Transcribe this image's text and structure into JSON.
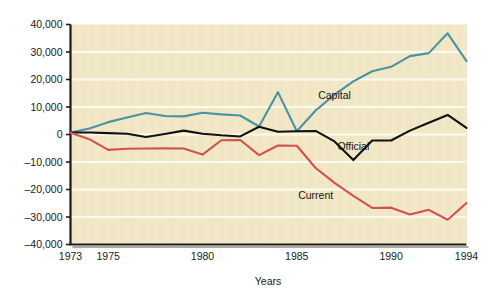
{
  "chart_data": {
    "type": "line",
    "title": "",
    "xlabel": "Years",
    "ylabel": "",
    "xlim": [
      1973,
      1994
    ],
    "ylim": [
      -40000,
      40000
    ],
    "grid": true,
    "legend_position": "inline-annotations",
    "background_color": "#f2e8c8",
    "x": [
      1973,
      1974,
      1975,
      1976,
      1977,
      1978,
      1979,
      1980,
      1981,
      1982,
      1983,
      1984,
      1985,
      1986,
      1987,
      1988,
      1989,
      1990,
      1991,
      1992,
      1993,
      1994
    ],
    "xticks": [
      1973,
      1975,
      1980,
      1985,
      1990,
      1994
    ],
    "xticklabels": [
      "1973",
      "1975",
      "1980",
      "1985",
      "1990",
      "1994"
    ],
    "yticks": [
      -40000,
      -30000,
      -20000,
      -10000,
      0,
      10000,
      20000,
      30000,
      40000
    ],
    "yticklabels": [
      "–40,000",
      "–30,000",
      "–20,000",
      "–10,000",
      "0",
      "10,000",
      "20,000",
      "30,000",
      "40,000"
    ],
    "series": [
      {
        "name": "Capital",
        "color": "#4a93a3",
        "label_x": 1987,
        "label_y": 13000,
        "values": [
          700,
          2200,
          4500,
          6200,
          7800,
          6700,
          6600,
          7900,
          7300,
          6900,
          2900,
          15400,
          1200,
          8700,
          14500,
          19300,
          23000,
          24600,
          28500,
          29600,
          36800,
          26700
        ]
      },
      {
        "name": "Official",
        "color": "#111111",
        "label_x": 1988,
        "label_y": -5800,
        "values": [
          700,
          700,
          500,
          300,
          -900,
          200,
          1400,
          300,
          -300,
          -700,
          2800,
          1000,
          1200,
          1300,
          -2500,
          -9300,
          -2200,
          -2200,
          1400,
          4300,
          7100,
          2400
        ]
      },
      {
        "name": "Current",
        "color": "#d05250",
        "label_x": 1986,
        "label_y": -23500,
        "values": [
          600,
          -1700,
          -5600,
          -5200,
          -5100,
          -5000,
          -5100,
          -7300,
          -2100,
          -2000,
          -7500,
          -4000,
          -4100,
          -12200,
          -17600,
          -22300,
          -26700,
          -26600,
          -29100,
          -27400,
          -31000,
          -24900
        ]
      }
    ]
  },
  "axis_titles": {
    "x": "Years"
  }
}
